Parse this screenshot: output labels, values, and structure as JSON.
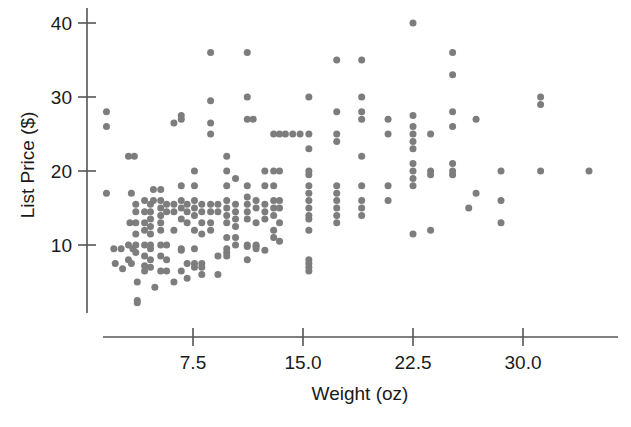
{
  "chart_data": {
    "type": "scatter",
    "title": "",
    "xlabel": "Weight (oz)",
    "ylabel": "List Price ($)",
    "xlim": [
      0.8,
      36.5
    ],
    "ylim": [
      1.0,
      41.5
    ],
    "xticks": [
      7.5,
      15.0,
      22.5,
      30.0
    ],
    "xtick_labels": [
      "7.5",
      "15.0",
      "22.5",
      "30.0"
    ],
    "yticks": [
      10,
      20,
      30,
      40
    ],
    "ytick_labels": [
      "10",
      "20",
      "30",
      "40"
    ],
    "grid": false,
    "legend": null,
    "marker_color": "#7d7d7d",
    "marker_size": 7,
    "points": [
      [
        1.6,
        28.0
      ],
      [
        1.6,
        26.0
      ],
      [
        1.6,
        17.0
      ],
      [
        2.1,
        9.5
      ],
      [
        2.6,
        9.5
      ],
      [
        2.2,
        7.5
      ],
      [
        2.7,
        6.8
      ],
      [
        3.1,
        22.0
      ],
      [
        3.5,
        22.0
      ],
      [
        3.3,
        17.0
      ],
      [
        3.2,
        13.0
      ],
      [
        3.1,
        10.0
      ],
      [
        3.4,
        9.5
      ],
      [
        3.1,
        8.0
      ],
      [
        3.3,
        7.5
      ],
      [
        3.6,
        15.5
      ],
      [
        3.6,
        14.5
      ],
      [
        3.6,
        13.0
      ],
      [
        3.6,
        11.5
      ],
      [
        3.6,
        10.0
      ],
      [
        3.6,
        9.0
      ],
      [
        3.7,
        5.0
      ],
      [
        3.7,
        2.5
      ],
      [
        3.7,
        2.2
      ],
      [
        4.2,
        16.0
      ],
      [
        4.2,
        14.5
      ],
      [
        4.2,
        13.0
      ],
      [
        4.2,
        12.0
      ],
      [
        4.2,
        10.0
      ],
      [
        4.2,
        8.5
      ],
      [
        4.2,
        7.2
      ],
      [
        4.2,
        6.5
      ],
      [
        4.6,
        15.5
      ],
      [
        4.6,
        14.5
      ],
      [
        4.6,
        13.5
      ],
      [
        4.6,
        12.5
      ],
      [
        4.6,
        11.5
      ],
      [
        4.6,
        10.0
      ],
      [
        4.6,
        9.5
      ],
      [
        4.6,
        8.0
      ],
      [
        4.6,
        7.0
      ],
      [
        4.8,
        17.5
      ],
      [
        4.8,
        16.0
      ],
      [
        4.9,
        4.3
      ],
      [
        5.3,
        17.5
      ],
      [
        5.3,
        16.0
      ],
      [
        5.3,
        15.0
      ],
      [
        5.3,
        14.0
      ],
      [
        5.3,
        13.0
      ],
      [
        5.3,
        12.0
      ],
      [
        5.3,
        10.0
      ],
      [
        5.3,
        8.5
      ],
      [
        5.3,
        6.5
      ],
      [
        5.7,
        15.5
      ],
      [
        5.7,
        14.5
      ],
      [
        5.7,
        10.0
      ],
      [
        5.7,
        8.0
      ],
      [
        5.7,
        6.5
      ],
      [
        6.2,
        26.5
      ],
      [
        6.2,
        15.5
      ],
      [
        6.2,
        14.5
      ],
      [
        6.2,
        12.0
      ],
      [
        6.2,
        5.0
      ],
      [
        6.7,
        27.5
      ],
      [
        6.7,
        27.0
      ],
      [
        6.7,
        18.0
      ],
      [
        6.7,
        16.0
      ],
      [
        6.7,
        15.0
      ],
      [
        6.7,
        13.5
      ],
      [
        6.7,
        9.5
      ],
      [
        6.7,
        9.3
      ],
      [
        6.7,
        6.5
      ],
      [
        7.1,
        15.5
      ],
      [
        7.1,
        14.5
      ],
      [
        7.1,
        13.0
      ],
      [
        7.1,
        7.5
      ],
      [
        7.1,
        5.5
      ],
      [
        7.6,
        20.0
      ],
      [
        7.6,
        18.0
      ],
      [
        7.6,
        16.0
      ],
      [
        7.6,
        15.0
      ],
      [
        7.6,
        14.0
      ],
      [
        7.6,
        12.0
      ],
      [
        7.6,
        9.5
      ],
      [
        7.6,
        7.5
      ],
      [
        7.6,
        7.0
      ],
      [
        8.1,
        15.5
      ],
      [
        8.1,
        14.5
      ],
      [
        8.1,
        13.0
      ],
      [
        8.1,
        11.5
      ],
      [
        8.1,
        7.5
      ],
      [
        8.1,
        7.0
      ],
      [
        8.1,
        6.0
      ],
      [
        8.7,
        36.0
      ],
      [
        8.7,
        29.5
      ],
      [
        8.7,
        26.5
      ],
      [
        8.7,
        25.0
      ],
      [
        8.7,
        15.5
      ],
      [
        8.7,
        14.5
      ],
      [
        8.7,
        13.0
      ],
      [
        8.7,
        12.0
      ],
      [
        9.2,
        15.5
      ],
      [
        9.2,
        14.5
      ],
      [
        9.2,
        8.5
      ],
      [
        9.2,
        6.0
      ],
      [
        9.8,
        22.0
      ],
      [
        9.8,
        20.0
      ],
      [
        9.8,
        18.0
      ],
      [
        9.8,
        16.0
      ],
      [
        9.8,
        15.0
      ],
      [
        9.8,
        14.0
      ],
      [
        9.8,
        13.0
      ],
      [
        9.8,
        11.0
      ],
      [
        9.8,
        9.5
      ],
      [
        9.8,
        9.0
      ],
      [
        9.8,
        8.5
      ],
      [
        10.4,
        19.0
      ],
      [
        10.4,
        15.5
      ],
      [
        10.4,
        14.5
      ],
      [
        10.4,
        13.5
      ],
      [
        10.4,
        12.5
      ],
      [
        10.4,
        11.0
      ],
      [
        10.4,
        10.0
      ],
      [
        11.2,
        36.0
      ],
      [
        11.2,
        30.0
      ],
      [
        11.2,
        27.0
      ],
      [
        11.6,
        27.0
      ],
      [
        11.2,
        18.0
      ],
      [
        11.2,
        16.5
      ],
      [
        11.2,
        15.5
      ],
      [
        11.2,
        14.5
      ],
      [
        11.2,
        13.5
      ],
      [
        11.2,
        10.0
      ],
      [
        11.2,
        9.8
      ],
      [
        11.2,
        8.0
      ],
      [
        11.8,
        16.0
      ],
      [
        11.8,
        15.0
      ],
      [
        11.8,
        13.0
      ],
      [
        11.8,
        10.0
      ],
      [
        11.8,
        9.8
      ],
      [
        11.8,
        9.5
      ],
      [
        12.4,
        20.0
      ],
      [
        12.4,
        18.0
      ],
      [
        12.4,
        15.5
      ],
      [
        12.4,
        14.5
      ],
      [
        12.4,
        13.5
      ],
      [
        12.4,
        9.3
      ],
      [
        13.0,
        25.0
      ],
      [
        13.4,
        25.0
      ],
      [
        13.8,
        25.0
      ],
      [
        14.3,
        25.0
      ],
      [
        14.8,
        25.0
      ],
      [
        15.4,
        25.0
      ],
      [
        13.0,
        20.0
      ],
      [
        13.4,
        20.0
      ],
      [
        13.0,
        18.0
      ],
      [
        13.0,
        16.0
      ],
      [
        13.0,
        15.0
      ],
      [
        13.0,
        14.0
      ],
      [
        13.0,
        12.0
      ],
      [
        13.0,
        11.0
      ],
      [
        13.4,
        16.0
      ],
      [
        13.4,
        15.0
      ],
      [
        13.4,
        13.0
      ],
      [
        13.4,
        10.5
      ],
      [
        15.4,
        30.0
      ],
      [
        15.4,
        23.0
      ],
      [
        15.4,
        20.0
      ],
      [
        15.4,
        19.5
      ],
      [
        15.4,
        18.0
      ],
      [
        15.4,
        17.0
      ],
      [
        15.4,
        16.0
      ],
      [
        15.4,
        15.0
      ],
      [
        15.4,
        14.0
      ],
      [
        15.4,
        13.5
      ],
      [
        15.4,
        12.0
      ],
      [
        15.4,
        8.0
      ],
      [
        15.4,
        7.5
      ],
      [
        15.4,
        7.0
      ],
      [
        15.4,
        6.5
      ],
      [
        17.3,
        35.0
      ],
      [
        17.3,
        28.0
      ],
      [
        17.3,
        25.0
      ],
      [
        17.3,
        24.0
      ],
      [
        17.3,
        18.0
      ],
      [
        17.3,
        17.0
      ],
      [
        17.3,
        16.0
      ],
      [
        17.3,
        15.0
      ],
      [
        17.3,
        14.0
      ],
      [
        17.3,
        13.0
      ],
      [
        19.0,
        35.0
      ],
      [
        19.0,
        30.0
      ],
      [
        19.0,
        28.0
      ],
      [
        19.0,
        27.0
      ],
      [
        19.0,
        22.0
      ],
      [
        19.0,
        18.0
      ],
      [
        19.0,
        16.0
      ],
      [
        19.0,
        15.0
      ],
      [
        19.0,
        14.0
      ],
      [
        20.8,
        27.0
      ],
      [
        20.8,
        25.0
      ],
      [
        20.8,
        18.0
      ],
      [
        20.8,
        16.0
      ],
      [
        22.5,
        40.0
      ],
      [
        22.5,
        27.5
      ],
      [
        22.5,
        26.0
      ],
      [
        22.5,
        25.0
      ],
      [
        22.5,
        24.0
      ],
      [
        22.5,
        23.0
      ],
      [
        22.5,
        21.0
      ],
      [
        22.5,
        20.0
      ],
      [
        22.5,
        19.0
      ],
      [
        22.5,
        18.0
      ],
      [
        22.5,
        11.5
      ],
      [
        23.7,
        25.0
      ],
      [
        23.7,
        20.0
      ],
      [
        23.7,
        19.5
      ],
      [
        23.7,
        12.0
      ],
      [
        25.2,
        36.0
      ],
      [
        25.2,
        33.0
      ],
      [
        25.2,
        28.0
      ],
      [
        25.2,
        26.0
      ],
      [
        25.2,
        21.0
      ],
      [
        25.2,
        20.0
      ],
      [
        25.2,
        19.5
      ],
      [
        26.8,
        27.0
      ],
      [
        26.8,
        17.0
      ],
      [
        26.3,
        15.0
      ],
      [
        28.5,
        20.0
      ],
      [
        28.5,
        16.0
      ],
      [
        28.5,
        13.0
      ],
      [
        31.2,
        30.0
      ],
      [
        31.2,
        29.0
      ],
      [
        31.2,
        20.0
      ],
      [
        34.5,
        20.0
      ]
    ]
  },
  "axes": {
    "x_axis_name": "x-axis",
    "y_axis_name": "y-axis"
  }
}
